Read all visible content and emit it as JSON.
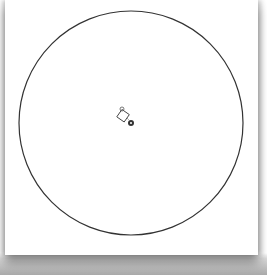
{
  "canvas": {
    "background": "#ffffff",
    "shape": {
      "type": "circle",
      "cx": 131,
      "cy": 123,
      "r": 112,
      "stroke": "#333333",
      "stroke_width": 1.2,
      "fill": "none"
    },
    "cursor": {
      "icon": "rotate-shape-cursor-icon",
      "x": 124,
      "y": 117
    }
  }
}
